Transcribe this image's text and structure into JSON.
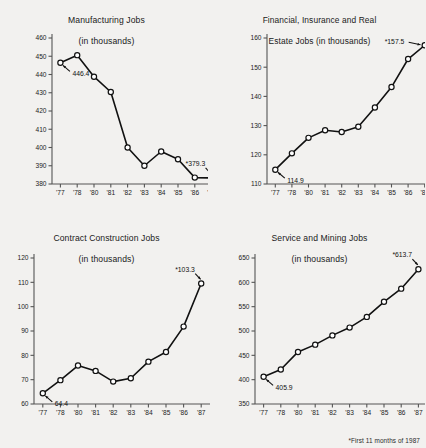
{
  "page": {
    "footnote": "*First 11 months of 1987",
    "background_color": "#f2f1ef",
    "line_color": "#111111",
    "marker_fill": "#ffffff",
    "axis_color": "#555555"
  },
  "charts": [
    {
      "id": "manufacturing-jobs",
      "position": "top-left",
      "title_line1": "Manufacturing Jobs",
      "title_line2": "(in thousands)",
      "first_label": "446.4",
      "last_label": "*379.3",
      "chart_data": {
        "type": "line",
        "title": "Manufacturing Jobs (in thousands)",
        "xlabel": "",
        "ylabel": "",
        "categories": [
          "'77",
          "'78",
          "'80",
          "'81",
          "'82",
          "'83",
          "'84",
          "'85",
          "'86",
          "'87"
        ],
        "values": [
          446.4,
          450.6,
          438.8,
          430.4,
          400.0,
          390.0,
          397.8,
          393.6,
          383.5,
          383.3
        ],
        "ylim": [
          380,
          460
        ],
        "yticks": [
          460,
          450,
          440,
          430,
          420,
          410,
          400,
          390,
          380
        ],
        "grid": false,
        "legend": "none",
        "annotations": [
          {
            "text": "446.4",
            "point_index": 0
          },
          {
            "text": "*379.3",
            "point_index": 9
          }
        ]
      }
    },
    {
      "id": "financial-insurance-real-estate-jobs",
      "position": "top-right",
      "title_line1": "Financial, Insurance and Real",
      "title_line2": "Estate Jobs (in thousands)",
      "first_label": "114.9",
      "last_label": "*157.5",
      "chart_data": {
        "type": "line",
        "title": "Financial, Insurance and Real Estate Jobs (in thousands)",
        "xlabel": "",
        "ylabel": "",
        "categories": [
          "'77",
          "'78",
          "'80",
          "'81",
          "'82",
          "'83",
          "'84",
          "'85",
          "'86",
          "'87"
        ],
        "values": [
          114.9,
          120.5,
          125.8,
          128.4,
          127.8,
          129.6,
          136.2,
          143.2,
          152.8,
          157.5
        ],
        "ylim": [
          110,
          160
        ],
        "yticks": [
          160,
          150,
          140,
          130,
          120,
          110
        ],
        "grid": false,
        "legend": "none",
        "annotations": [
          {
            "text": "114.9",
            "point_index": 0
          },
          {
            "text": "*157.5",
            "point_index": 9
          }
        ]
      }
    },
    {
      "id": "contract-construction-jobs",
      "position": "bottom-left",
      "title_line1": "Contract Construction Jobs",
      "title_line2": "(in thousands)",
      "first_label": "64.4",
      "last_label": "*103.3",
      "chart_data": {
        "type": "line",
        "title": "Contract Construction Jobs (in thousands)",
        "xlabel": "",
        "ylabel": "",
        "categories": [
          "'77",
          "'78",
          "'80",
          "'81",
          "'82",
          "'83",
          "'84",
          "'85",
          "'86",
          "'87"
        ],
        "values": [
          64.4,
          69.8,
          75.8,
          73.6,
          69.2,
          70.6,
          77.4,
          81.4,
          91.8,
          109.5
        ],
        "ylim": [
          60,
          120
        ],
        "yticks": [
          120,
          110,
          100,
          90,
          80,
          70,
          60
        ],
        "grid": false,
        "legend": "none",
        "annotations": [
          {
            "text": "64.4",
            "point_index": 0
          },
          {
            "text": "*103.3",
            "point_index": 9
          }
        ]
      }
    },
    {
      "id": "service-and-mining-jobs",
      "position": "bottom-right",
      "title_line1": "Service and Mining Jobs",
      "title_line2": "(in thousands)",
      "first_label": "405.9",
      "last_label": "*613.7",
      "chart_data": {
        "type": "line",
        "title": "Service and Mining Jobs (in thousands)",
        "xlabel": "",
        "ylabel": "",
        "categories": [
          "'77",
          "'78",
          "'80",
          "'81",
          "'82",
          "'83",
          "'84",
          "'85",
          "'86",
          "'87"
        ],
        "values": [
          405.9,
          421.0,
          457.0,
          472.0,
          491.0,
          507.0,
          529.0,
          560.0,
          587.0,
          627.0
        ],
        "ylim": [
          350,
          650
        ],
        "yticks": [
          650,
          600,
          550,
          500,
          450,
          400,
          350
        ],
        "grid": false,
        "legend": "none",
        "annotations": [
          {
            "text": "405.9",
            "point_index": 0
          },
          {
            "text": "*613.7",
            "point_index": 9
          }
        ]
      }
    }
  ]
}
